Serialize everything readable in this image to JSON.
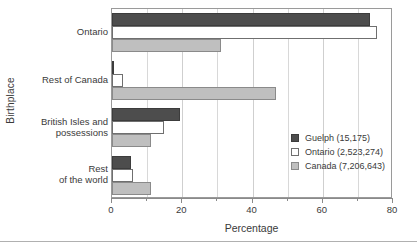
{
  "chart_data": {
    "type": "bar",
    "orientation": "horizontal",
    "title": "",
    "xlabel": "Percentage",
    "ylabel": "Birthplace",
    "xlim": [
      0,
      80
    ],
    "xticks": [
      0,
      20,
      40,
      60,
      80
    ],
    "xticklabels": [
      "0",
      "20",
      "40",
      "60",
      "80"
    ],
    "minor_xticks": [
      10,
      30,
      50,
      70
    ],
    "grid": true,
    "grid_axis": "x",
    "legend_position": "center-right-inside",
    "categories": [
      "Ontario",
      "Rest of Canada",
      "British Isles and possessions",
      "Rest of the world"
    ],
    "category_labels": [
      [
        "Ontario"
      ],
      [
        "Rest of Canada"
      ],
      [
        "British Isles and",
        "possessions"
      ],
      [
        "Rest",
        "of the world"
      ]
    ],
    "series": [
      {
        "name": "Guelph (15,175)",
        "short_name": "Guelph",
        "count": "15,175",
        "color": "#4d4d4d",
        "values": [
          73.5,
          0.7,
          19.5,
          5.5
        ]
      },
      {
        "name": "Ontario (2,523,274)",
        "short_name": "Ontario",
        "count": "2,523,274",
        "color": "#ffffff",
        "values": [
          75.5,
          3.0,
          14.7,
          6.0
        ]
      },
      {
        "name": "Canada (7,206,643)",
        "short_name": "Canada",
        "count": "7,206,643",
        "color": "#bfbfbf",
        "values": [
          31.0,
          46.7,
          11.2,
          11.0
        ]
      }
    ]
  }
}
